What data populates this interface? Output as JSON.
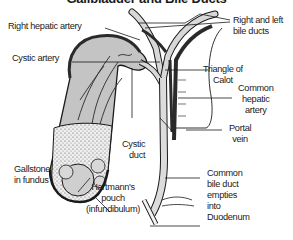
{
  "title": "Gallbladder and Bile Ducts",
  "labels": {
    "right_hepatic_artery": "Right hepatic artery",
    "right_left_bile_ducts_1": "Right and left",
    "right_left_bile_ducts_2": "bile ducts",
    "cystic_artery": "Cystic artery",
    "triangle_of_calot_1": "Triangle of",
    "triangle_of_calot_2": "Calot",
    "common_hepatic_artery_1": "Common",
    "common_hepatic_artery_2": "hepatic",
    "common_hepatic_artery_3": "artery",
    "portal_vein_1": "Portal",
    "portal_vein_2": "vein",
    "cystic_duct_1": "Cystic",
    "cystic_duct_2": "duct",
    "gallstone_1": "Gallstone",
    "gallstone_2": "in fundus",
    "hartmanns_1": "Hartmann's",
    "hartmanns_2": "pouch",
    "hartmanns_3": "(infundibulum)",
    "cbd_1": "Common",
    "cbd_2": "bile duct",
    "cbd_3": "empties",
    "cbd_4": "into",
    "cbd_5": "Duodenum"
  },
  "colors": {
    "gallbladder_fill": "#c4c4c4",
    "duct_fill": "#d8d8d8",
    "artery_dark": "#2a2a2a",
    "outline": "#1a1a1a"
  }
}
